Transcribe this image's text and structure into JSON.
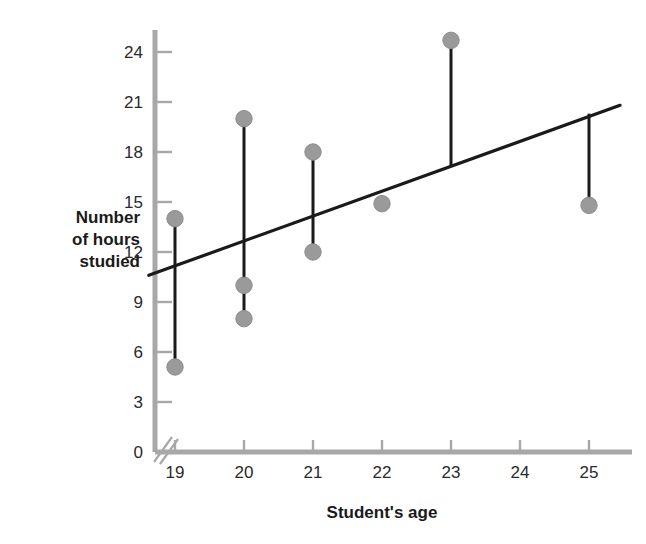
{
  "chart_data": {
    "type": "scatter",
    "title": "",
    "xlabel": "Student's age",
    "ylabel": "Number of hours studied",
    "ylabel_lines": [
      "Number",
      "of hours",
      "studied"
    ],
    "xlim": [
      18.62,
      25.45
    ],
    "ylim": [
      0,
      25.8
    ],
    "xticks": [
      19,
      20,
      21,
      22,
      23,
      24,
      25
    ],
    "xtick_labels": [
      "19",
      "20",
      "21",
      "22",
      "23",
      "24",
      "25"
    ],
    "yticks": [
      0,
      3,
      6,
      9,
      12,
      15,
      18,
      21,
      24
    ],
    "ytick_labels": [
      "0",
      "3",
      "6",
      "9",
      "12",
      "15",
      "18",
      "21",
      "24"
    ],
    "grid": false,
    "legend": false,
    "axis_break": true,
    "points": [
      {
        "x": 19,
        "y": 14.0
      },
      {
        "x": 19,
        "y": 5.1
      },
      {
        "x": 20,
        "y": 20.0
      },
      {
        "x": 20,
        "y": 10.0
      },
      {
        "x": 20,
        "y": 8.0
      },
      {
        "x": 21,
        "y": 18.0
      },
      {
        "x": 21,
        "y": 12.0
      },
      {
        "x": 22,
        "y": 14.9
      },
      {
        "x": 23,
        "y": 24.7
      },
      {
        "x": 25,
        "y": 14.8
      }
    ],
    "residual_segments": [
      {
        "x": 19,
        "y1": 14.0,
        "y2": 5.1
      },
      {
        "x": 20,
        "y1": 20.0,
        "y2": 8.0
      },
      {
        "x": 21,
        "y1": 18.0,
        "y2": 12.0
      },
      {
        "x": 22,
        "y1": 15.3,
        "y2": 14.9
      },
      {
        "x": 23,
        "y1": 24.7,
        "y2": 17.2
      },
      {
        "x": 25,
        "y1": 20.3,
        "y2": 14.8
      }
    ],
    "regression_line": {
      "name": "line of best fit",
      "x1": 18.62,
      "y1": 10.6,
      "x2": 25.45,
      "y2": 20.8
    },
    "colors": {
      "point": "#9a9a9a",
      "point_edge": "#8d8d8d",
      "line": "#1a1a1a",
      "axis": "#a8a8a8",
      "tick": "#a8a8a8",
      "text": "#1a1a1a",
      "background": "#ffffff"
    }
  },
  "axis_titles": {
    "x": "Student's age",
    "y_line1": "Number",
    "y_line2": "of hours",
    "y_line3": "studied"
  }
}
